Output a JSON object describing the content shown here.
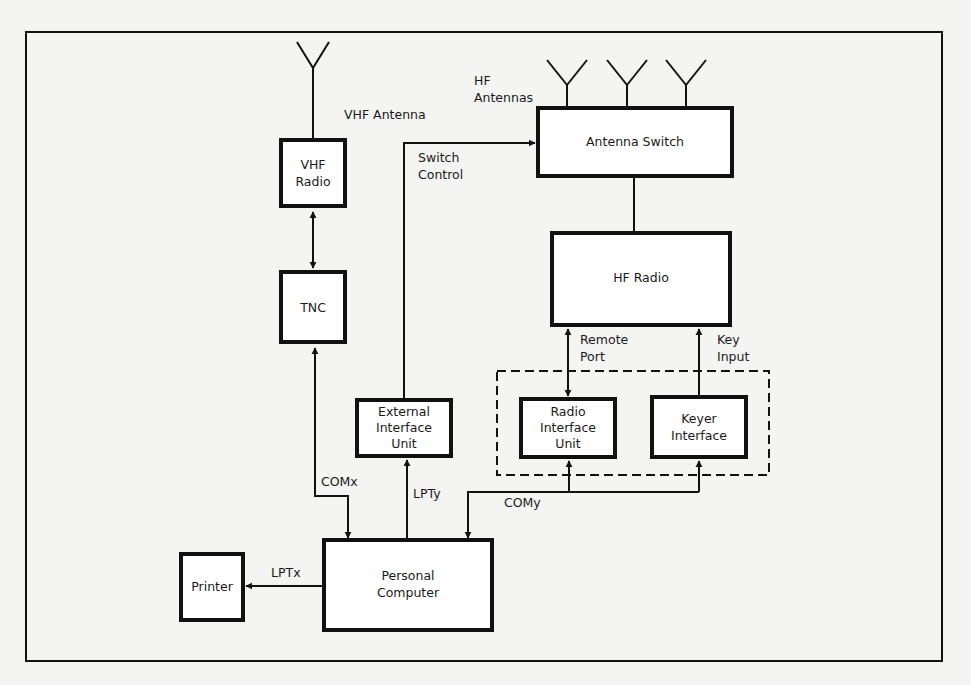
{
  "diagram": {
    "title": "",
    "blocks": {
      "vhf_radio": {
        "lines": [
          "VHF",
          "Radio"
        ]
      },
      "tnc": {
        "lines": [
          "TNC"
        ]
      },
      "antenna_switch": {
        "lines": [
          "Antenna Switch"
        ]
      },
      "hf_radio": {
        "lines": [
          "HF Radio"
        ]
      },
      "external_interface_unit": {
        "lines": [
          "External",
          "Interface",
          "Unit"
        ]
      },
      "radio_interface_unit": {
        "lines": [
          "Radio",
          "Interface",
          "Unit"
        ]
      },
      "keyer_interface": {
        "lines": [
          "Keyer",
          "Interface"
        ]
      },
      "personal_computer": {
        "lines": [
          "Personal",
          "Computer"
        ]
      },
      "printer": {
        "lines": [
          "Printer"
        ]
      }
    },
    "labels": {
      "vhf_antenna": "VHF Antenna",
      "hf_antennas": [
        "HF",
        "Antennas"
      ],
      "switch_control": [
        "Switch",
        "Control"
      ],
      "remote_port": [
        "Remote",
        "Port"
      ],
      "key_input": [
        "Key",
        "Input"
      ],
      "comx": "COMx",
      "lpty": "LPTy",
      "comy": "COMy",
      "lptx": "LPTx"
    },
    "connections": [
      {
        "from": "vhf_radio",
        "to": "tnc",
        "type": "bidirectional"
      },
      {
        "from": "personal_computer",
        "to": "tnc",
        "label": "COMx",
        "type": "bidirectional"
      },
      {
        "from": "personal_computer",
        "to": "external_interface_unit",
        "label": "LPTy",
        "type": "arrow"
      },
      {
        "from": "external_interface_unit",
        "to": "antenna_switch",
        "label": "Switch Control",
        "type": "arrow"
      },
      {
        "from": "antenna_switch",
        "to": "hf_radio",
        "type": "line"
      },
      {
        "from": "hf_radio",
        "to": "radio_interface_unit",
        "label": "Remote Port",
        "type": "bidirectional"
      },
      {
        "from": "keyer_interface",
        "to": "hf_radio",
        "label": "Key Input",
        "type": "arrow"
      },
      {
        "from": "personal_computer",
        "to": "radio_interface_unit",
        "label": "COMy",
        "type": "bidirectional"
      },
      {
        "from": "personal_computer",
        "to": "keyer_interface",
        "label": "COMy",
        "type": "arrow"
      },
      {
        "from": "personal_computer",
        "to": "printer",
        "label": "LPTx",
        "type": "arrow"
      }
    ],
    "colors": {
      "ink": "#111111",
      "paper": "#f4f4f2",
      "block_fill": "#ffffff"
    }
  }
}
